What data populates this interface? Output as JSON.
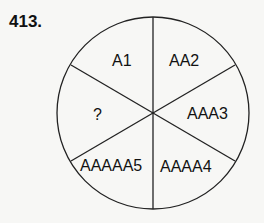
{
  "puzzle": {
    "number": "413.",
    "segments": [
      {
        "position": "top-left",
        "label": "A1"
      },
      {
        "position": "top-right",
        "label": "AA2"
      },
      {
        "position": "right",
        "label": "AAA3"
      },
      {
        "position": "bottom-right",
        "label": "AAAA4"
      },
      {
        "position": "bottom-left",
        "label": "AAAAA5"
      },
      {
        "position": "left",
        "label": "?"
      }
    ]
  }
}
